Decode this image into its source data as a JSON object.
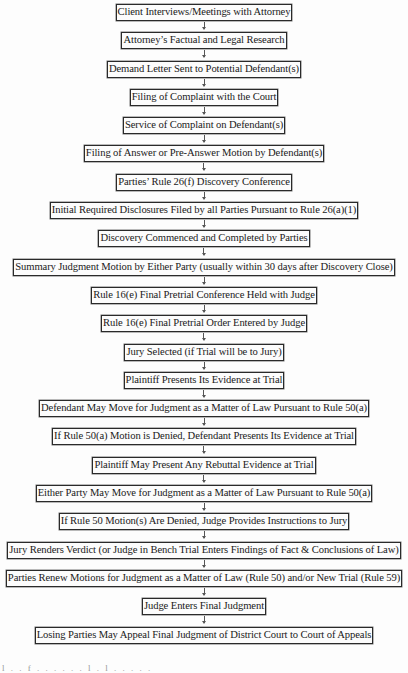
{
  "diagram": {
    "type": "vertical-flowchart",
    "title": "",
    "steps": [
      {
        "label": "Client Interviews/Meetings with Attorney"
      },
      {
        "label": "Attorney’s Factual and Legal Research"
      },
      {
        "label": "Demand Letter Sent to Potential Defendant(s)"
      },
      {
        "label": "Filing of Complaint with the Court"
      },
      {
        "label": "Service of Complaint on Defendant(s)"
      },
      {
        "label": "Filing of Answer or Pre-Answer Motion by Defendant(s)"
      },
      {
        "label": "Parties’ Rule 26(f) Discovery Conference"
      },
      {
        "label": "Initial Required Disclosures Filed by all Parties Pursuant to Rule 26(a)(1)"
      },
      {
        "label": "Discovery Commenced and Completed by Parties"
      },
      {
        "label": "Summary Judgment Motion by Either Party (usually within 30 days after Discovery Close)"
      },
      {
        "label": "Rule 16(e) Final Pretrial Conference Held with Judge"
      },
      {
        "label": "Rule 16(e) Final Pretrial Order Entered by Judge"
      },
      {
        "label": "Jury Selected (if Trial will be to Jury)"
      },
      {
        "label": "Plaintiff Presents Its Evidence at Trial"
      },
      {
        "label": "Defendant May Move for Judgment as a Matter of Law Pursuant to Rule 50(a)"
      },
      {
        "label": "If Rule 50(a) Motion is Denied, Defendant Presents Its Evidence at Trial"
      },
      {
        "label": "Plaintiff May Present Any Rebuttal Evidence at Trial"
      },
      {
        "label": "Either Party May Move for Judgment as a Matter of Law Pursuant to Rule 50(a)"
      },
      {
        "label": "If Rule 50 Motion(s) Are Denied, Judge Provides Instructions to Jury"
      },
      {
        "label": "Jury Renders Verdict (or Judge in Bench Trial Enters Findings of Fact & Conclusions of Law)"
      },
      {
        "label": "Parties Renew Motions for Judgment as a Matter of Law (Rule 50) and/or New Trial (Rule 59)"
      },
      {
        "label": "Judge Enters Final Judgment"
      },
      {
        "label": "Losing Parties May Appeal Final Judgment of District Court to Court of Appeals"
      }
    ],
    "connector_icon": "down-arrow-icon",
    "colors": {
      "background": "#fdfdfd",
      "border": "#2a2a2a",
      "text": "#1a1a1a",
      "arrow": "#555555"
    }
  },
  "footer": {
    "fragment": "l . . f . . . . . . l . l . . . . ."
  }
}
